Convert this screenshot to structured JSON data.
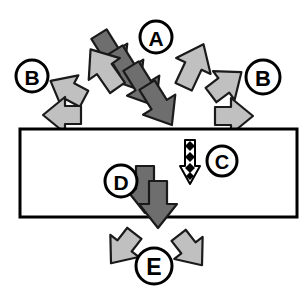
{
  "diagram": {
    "background_color": "#ffffff",
    "canvas": {
      "width": 308,
      "height": 289
    },
    "colors": {
      "dark_arrow_fill": "#6e6e6e",
      "light_arrow_fill": "#c0c0c0",
      "outline": "#1a1a1a",
      "band_fill": "#ffffff",
      "band_stroke": "#000000",
      "label_circle_fill": "#ffffff",
      "label_circle_stroke": "#000000",
      "label_text_color": "#000000",
      "diamond_fill": "#000000",
      "thin_arrow_fill": "#ffffff"
    },
    "band": {
      "name": "horizontal-band",
      "x": 20,
      "y": 129,
      "width": 277,
      "height": 88,
      "stroke_width": 3
    },
    "labels": [
      {
        "id": "A",
        "text": "A",
        "cx": 156,
        "cy": 37,
        "r": 16,
        "description": "cascade of dark arrows entering band from upper area"
      },
      {
        "id": "B-left",
        "text": "B",
        "cx": 32,
        "cy": 76,
        "r": 16,
        "description": "light arrows radiating left and upper-left"
      },
      {
        "id": "B-right",
        "text": "B",
        "cx": 263,
        "cy": 77,
        "r": 17,
        "description": "light arrows radiating right and upper-right"
      },
      {
        "id": "C",
        "text": "C",
        "cx": 222,
        "cy": 161,
        "r": 15,
        "description": "thin white arrow with black diamonds descending through band"
      },
      {
        "id": "D",
        "text": "D",
        "cx": 121,
        "cy": 181,
        "r": 16,
        "description": "dark arrows continuing downward inside band"
      },
      {
        "id": "E",
        "text": "E",
        "cx": 154,
        "cy": 266,
        "r": 18,
        "description": "light arrows splaying outward below band"
      }
    ],
    "arrow_groups": [
      {
        "group": "A-cascade",
        "style": "dark",
        "count": 4,
        "direction": "down-right",
        "angle_deg": 58,
        "note": "four overlapping dark gray arrows converging at top edge of band"
      },
      {
        "group": "B-left",
        "style": "light",
        "count": 3,
        "directions": [
          "up-left",
          "left",
          "left"
        ],
        "note": "light gray arrows radiating away to the left"
      },
      {
        "group": "B-right",
        "style": "light",
        "count": 3,
        "directions": [
          "up-right",
          "up-right",
          "right"
        ],
        "note": "light gray arrows radiating away to the right"
      },
      {
        "group": "C-thin",
        "style": "outlined-white",
        "count": 1,
        "direction": "down",
        "diamonds": 4,
        "note": "narrow white arrow with stacked black diamonds inside the band"
      },
      {
        "group": "D-dark",
        "style": "dark",
        "count": 2,
        "direction": "down",
        "note": "two overlapping dark gray arrows descending inside the band"
      },
      {
        "group": "E-split",
        "style": "light",
        "count": 2,
        "directions": [
          "down-left",
          "down-right"
        ],
        "note": "two light gray arrows splaying outward beneath the band"
      }
    ]
  }
}
